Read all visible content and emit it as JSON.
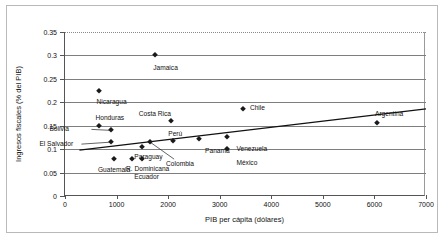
{
  "chart_data": {
    "type": "scatter",
    "title": "",
    "xlabel": "PIB per cápita (dólares)",
    "ylabel": "Ingresos fiscales (% del PIB)",
    "xlim": [
      0,
      7000
    ],
    "ylim": [
      0,
      0.35
    ],
    "xticks": [
      "0",
      "1000",
      "2000",
      "3000",
      "4000",
      "5000",
      "6000",
      "7000"
    ],
    "xtick_values": [
      0,
      1000,
      2000,
      3000,
      4000,
      5000,
      6000,
      7000
    ],
    "yticks": [
      "0",
      "0.05",
      "0.1",
      "0.15",
      "0.2",
      "0.25",
      "0.3",
      "0.35"
    ],
    "ytick_values": [
      0,
      0.05,
      0.1,
      0.15,
      0.2,
      0.25,
      0.3,
      0.35
    ],
    "grid": "horizontal",
    "legend": "none",
    "marker_style": "filled-diamond",
    "marker_color": "#1a1a1a",
    "points": [
      {
        "name": "Nicaragua",
        "x": 650,
        "y": 0.225,
        "label_dx": -2,
        "label_dy": 11,
        "leader": false
      },
      {
        "name": "Jamaica",
        "x": 1750,
        "y": 0.3,
        "label_dx": -2,
        "label_dy": 13,
        "leader": false
      },
      {
        "name": "Honduras",
        "x": 650,
        "y": 0.15,
        "label_dx": -3,
        "label_dy": -8,
        "leader": false
      },
      {
        "name": "Bolivia",
        "x": 900,
        "y": 0.14,
        "label_dx": -62,
        "label_dy": -1,
        "leader": true
      },
      {
        "name": "El Salvador",
        "x": 900,
        "y": 0.115,
        "label_dx": -72,
        "label_dy": 2,
        "leader": true
      },
      {
        "name": "Guatemala",
        "x": 950,
        "y": 0.08,
        "label_dx": -16,
        "label_dy": 11,
        "leader": false
      },
      {
        "name": "R. Dominicana",
        "x": 1300,
        "y": 0.08,
        "label_dx": -6,
        "label_dy": 10,
        "leader": false
      },
      {
        "name": "Paraguay",
        "x": 1500,
        "y": 0.105,
        "label_dx": -8,
        "label_dy": 10,
        "leader": false
      },
      {
        "name": "Ecuador",
        "x": 1500,
        "y": 0.08,
        "label_dx": -8,
        "label_dy": 18,
        "leader": false
      },
      {
        "name": "Colombia",
        "x": 1650,
        "y": 0.115,
        "label_dx": 16,
        "label_dy": 22,
        "leader": true
      },
      {
        "name": "Costa Rica",
        "x": 2050,
        "y": 0.16,
        "label_dx": -32,
        "label_dy": -7,
        "leader": false
      },
      {
        "name": "Perú",
        "x": 2100,
        "y": 0.118,
        "label_dx": -5,
        "label_dy": -7,
        "leader": false
      },
      {
        "name": "Panamá",
        "x": 2600,
        "y": 0.122,
        "label_dx": 6,
        "label_dy": 12,
        "leader": false
      },
      {
        "name": "Venezuela",
        "x": 3150,
        "y": 0.125,
        "label_dx": 9,
        "label_dy": 12,
        "leader": false
      },
      {
        "name": "México",
        "x": 3150,
        "y": 0.1,
        "label_dx": 9,
        "label_dy": 14,
        "leader": false
      },
      {
        "name": "Chile",
        "x": 3450,
        "y": 0.185,
        "label_dx": 7,
        "label_dy": -1,
        "leader": false
      },
      {
        "name": "Argentina",
        "x": 6050,
        "y": 0.155,
        "label_dx": -2,
        "label_dy": -9,
        "leader": false
      }
    ],
    "trendline": {
      "x0": 280,
      "y0": 0.098,
      "x1": 7000,
      "y1": 0.186
    }
  }
}
